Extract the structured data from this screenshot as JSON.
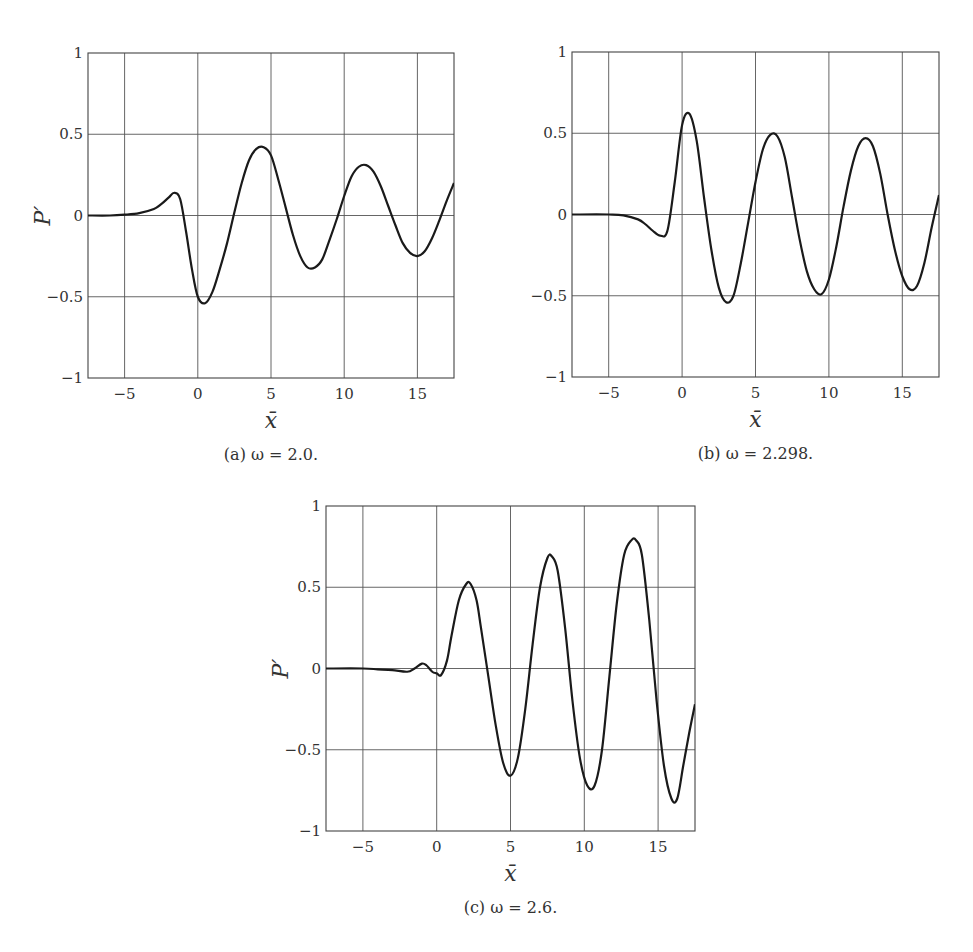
{
  "figure": {
    "panels": [
      {
        "id": "a",
        "caption": "(a) ω = 2.0.",
        "ylabel": "P′",
        "xlabel": "x̄",
        "box": {
          "left": 88,
          "top": 53,
          "right": 454,
          "bottom": 378
        }
      },
      {
        "id": "b",
        "caption": "(b) ω = 2.298.",
        "ylabel": "",
        "xlabel": "x̄",
        "box": {
          "left": 572,
          "top": 52,
          "right": 939,
          "bottom": 377
        }
      },
      {
        "id": "c",
        "caption": "(c) ω = 2.6.",
        "ylabel": "P′",
        "xlabel": "x̄",
        "box": {
          "left": 326,
          "top": 506,
          "right": 695,
          "bottom": 831
        }
      }
    ],
    "xticks": [
      "−5",
      "0",
      "5",
      "10",
      "15"
    ],
    "yticks": [
      "1",
      "0.5",
      "0",
      "−0.5",
      "−1"
    ],
    "line_color": "#1a1a1a",
    "grid_color": "#555555"
  },
  "chart_data": [
    {
      "type": "line",
      "title": "(a) ω = 2.0.",
      "xlabel": "x̄",
      "ylabel": "P′",
      "xlim": [
        -7.5,
        17.5
      ],
      "ylim": [
        -1,
        1
      ],
      "xticks": [
        -5,
        0,
        5,
        10,
        15
      ],
      "yticks": [
        -1,
        -0.5,
        0,
        0.5,
        1
      ],
      "grid": true,
      "series": [
        {
          "name": "P′",
          "x": [
            -7.5,
            -6,
            -5,
            -4,
            -3,
            -2.5,
            -2,
            -1.6,
            -1.2,
            -0.8,
            -0.4,
            0,
            0.5,
            1,
            1.5,
            2,
            2.5,
            3,
            3.5,
            4,
            4.5,
            5,
            5.5,
            6,
            6.5,
            7,
            7.5,
            8,
            8.5,
            9,
            9.5,
            10,
            10.5,
            11,
            11.5,
            12,
            12.5,
            13,
            13.5,
            14,
            14.5,
            15,
            15.5,
            16,
            16.5,
            17,
            17.5
          ],
          "y": [
            0,
            0,
            0.005,
            0.015,
            0.04,
            0.07,
            0.11,
            0.14,
            0.1,
            -0.1,
            -0.33,
            -0.5,
            -0.54,
            -0.47,
            -0.33,
            -0.17,
            0.02,
            0.2,
            0.34,
            0.41,
            0.42,
            0.37,
            0.22,
            0.05,
            -0.12,
            -0.25,
            -0.32,
            -0.32,
            -0.27,
            -0.15,
            -0.02,
            0.12,
            0.24,
            0.3,
            0.31,
            0.27,
            0.18,
            0.06,
            -0.06,
            -0.17,
            -0.23,
            -0.25,
            -0.22,
            -0.14,
            -0.03,
            0.09,
            0.2
          ]
        }
      ]
    },
    {
      "type": "line",
      "title": "(b) ω = 2.298.",
      "xlabel": "x̄",
      "ylabel": "",
      "xlim": [
        -7.5,
        17.5
      ],
      "ylim": [
        -1,
        1
      ],
      "xticks": [
        -5,
        0,
        5,
        10,
        15
      ],
      "yticks": [
        -1,
        -0.5,
        0,
        0.5,
        1
      ],
      "grid": true,
      "series": [
        {
          "name": "P′",
          "x": [
            -7.5,
            -5,
            -4,
            -3,
            -2.5,
            -2,
            -1.5,
            -1,
            -0.5,
            0,
            0.5,
            1,
            1.5,
            2,
            2.5,
            3,
            3.5,
            4,
            4.5,
            5,
            5.5,
            6,
            6.5,
            7,
            7.5,
            8,
            8.5,
            9,
            9.5,
            10,
            10.5,
            11,
            11.5,
            12,
            12.5,
            13,
            13.5,
            14,
            14.5,
            15,
            15.5,
            16,
            16.5,
            17,
            17.5
          ],
          "y": [
            0,
            0,
            -0.005,
            -0.03,
            -0.06,
            -0.1,
            -0.13,
            -0.1,
            0.2,
            0.55,
            0.62,
            0.45,
            0.1,
            -0.22,
            -0.45,
            -0.54,
            -0.5,
            -0.3,
            -0.05,
            0.2,
            0.4,
            0.49,
            0.48,
            0.35,
            0.1,
            -0.15,
            -0.35,
            -0.46,
            -0.49,
            -0.4,
            -0.2,
            0.05,
            0.27,
            0.42,
            0.47,
            0.42,
            0.25,
            0.0,
            -0.22,
            -0.38,
            -0.46,
            -0.44,
            -0.3,
            -0.08,
            0.12
          ]
        }
      ]
    },
    {
      "type": "line",
      "title": "(c) ω = 2.6.",
      "xlabel": "x̄",
      "ylabel": "P′",
      "xlim": [
        -7.5,
        17.5
      ],
      "ylim": [
        -1,
        1
      ],
      "xticks": [
        -5,
        0,
        5,
        10,
        15
      ],
      "yticks": [
        -1,
        -0.5,
        0,
        0.5,
        1
      ],
      "grid": true,
      "series": [
        {
          "name": "P′",
          "x": [
            -7.5,
            -5,
            -4,
            -3,
            -2,
            -1.5,
            -1,
            -0.7,
            -0.3,
            0,
            0.3,
            0.7,
            1,
            1.5,
            2,
            2.3,
            2.7,
            3,
            3.5,
            4,
            4.5,
            5,
            5.5,
            6,
            6.5,
            7,
            7.5,
            7.8,
            8.2,
            8.7,
            9.2,
            9.7,
            10.2,
            10.7,
            11.2,
            11.7,
            12.2,
            12.7,
            13.2,
            13.5,
            13.9,
            14.4,
            14.9,
            15.4,
            15.9,
            16.3,
            16.7,
            17.1,
            17.5
          ],
          "y": [
            0,
            0,
            -0.005,
            -0.01,
            -0.02,
            0.0,
            0.03,
            0.02,
            -0.02,
            -0.03,
            -0.04,
            0.05,
            0.2,
            0.42,
            0.52,
            0.52,
            0.42,
            0.25,
            -0.05,
            -0.35,
            -0.58,
            -0.66,
            -0.55,
            -0.25,
            0.15,
            0.5,
            0.68,
            0.69,
            0.6,
            0.25,
            -0.2,
            -0.55,
            -0.72,
            -0.72,
            -0.5,
            -0.05,
            0.4,
            0.7,
            0.79,
            0.79,
            0.7,
            0.3,
            -0.2,
            -0.6,
            -0.8,
            -0.8,
            -0.6,
            -0.4,
            -0.22
          ]
        }
      ]
    }
  ]
}
